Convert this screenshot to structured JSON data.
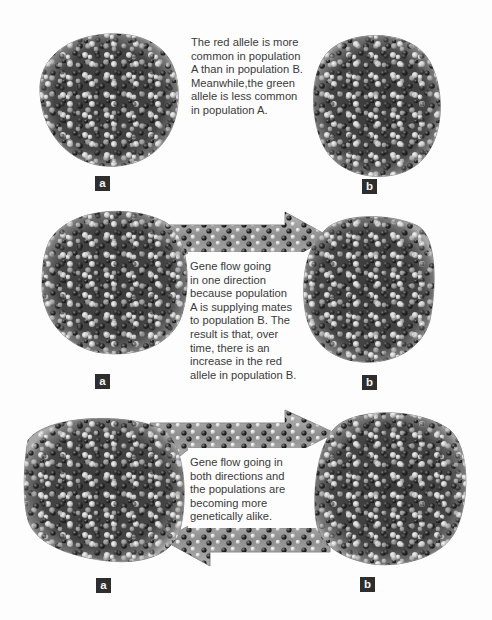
{
  "figure": {
    "colors": {
      "population_fill": "#3c3c3c",
      "population_rim": "#8a8a8a",
      "light_allele": "#d8d8d8",
      "dark_allele": "#1e1e1e",
      "arrow_fill": "#9c9c9c",
      "label_bg": "#2e2e2e",
      "text": "#3a3a3a"
    },
    "panels": [
      {
        "id": "panel-1",
        "caption": "The red allele is more\ncommon in population\nA than in population B.\nMeanwhile,the green\nallele is less common\nin population A.",
        "label_a": "a",
        "label_b": "b",
        "gene_flow": "none"
      },
      {
        "id": "panel-2",
        "caption": "Gene flow going\nin one direction\nbecause population\nA is supplying mates\nto population B. The\nresult is that, over\ntime, there is an\nincrease in the red\nallele in population B.",
        "label_a": "a",
        "label_b": "b",
        "gene_flow": "a-to-b"
      },
      {
        "id": "panel-3",
        "caption": "Gene flow going in\nboth directions and\nthe populations are\n  becoming more\n       genetically alike.",
        "label_a": "a",
        "label_b": "b",
        "gene_flow": "bidirectional"
      }
    ]
  }
}
